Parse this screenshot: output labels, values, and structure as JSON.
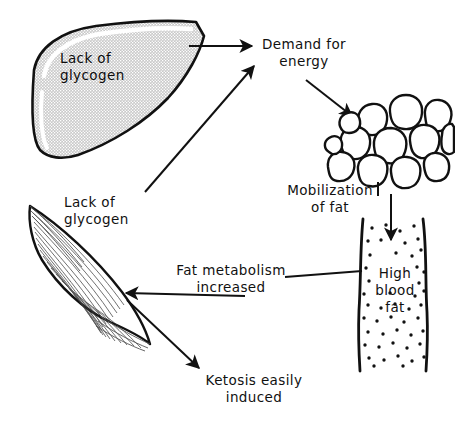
{
  "diagram": {
    "type": "flow-diagram",
    "background_color": "#ffffff",
    "ink_color": "#111111",
    "liver_fill_color": "#c8c8c8",
    "labels": {
      "liver": {
        "line1": "Lack of",
        "line2": "glycogen"
      },
      "demand": {
        "line1": "Demand for",
        "line2": "energy"
      },
      "mobilization": {
        "line1": "Mobilization",
        "line2": "of fat"
      },
      "high_blood_fat": {
        "line1": "High",
        "line2": "blood",
        "line3": "fat"
      },
      "muscle": {
        "line1": "Lack of",
        "line2": "glycogen"
      },
      "fat_metabolism": {
        "line1": "Fat metabolism",
        "line2": "increased"
      },
      "ketosis": {
        "line1": "Ketosis easily",
        "line2": "induced"
      }
    },
    "organs": [
      {
        "name": "liver",
        "shape": "wedge",
        "fill": "stippled-gray"
      },
      {
        "name": "adipose-tissue",
        "shape": "fat-cell-cluster",
        "cell_count": 13
      },
      {
        "name": "blood-vessel",
        "shape": "vertical-tube",
        "content": "stippled-dots"
      },
      {
        "name": "skeletal-muscle",
        "shape": "spindle",
        "striations": true
      }
    ],
    "connections": [
      {
        "from": "liver",
        "to": "demand",
        "style": "arrow"
      },
      {
        "from": "muscle",
        "to": "demand",
        "style": "arrow"
      },
      {
        "from": "demand",
        "to": "adipose-tissue",
        "style": "arrow"
      },
      {
        "from": "adipose-tissue",
        "to": "blood-vessel",
        "style": "arrow"
      },
      {
        "from": "fat-metabolism",
        "to": "muscle",
        "style": "arrow"
      },
      {
        "from": "fat-metabolism",
        "to": "blood-vessel",
        "style": "line"
      },
      {
        "from": "mobilization",
        "to": "adipose-tissue",
        "style": "line"
      },
      {
        "from": "muscle",
        "to": "ketosis",
        "style": "arrow"
      }
    ]
  }
}
